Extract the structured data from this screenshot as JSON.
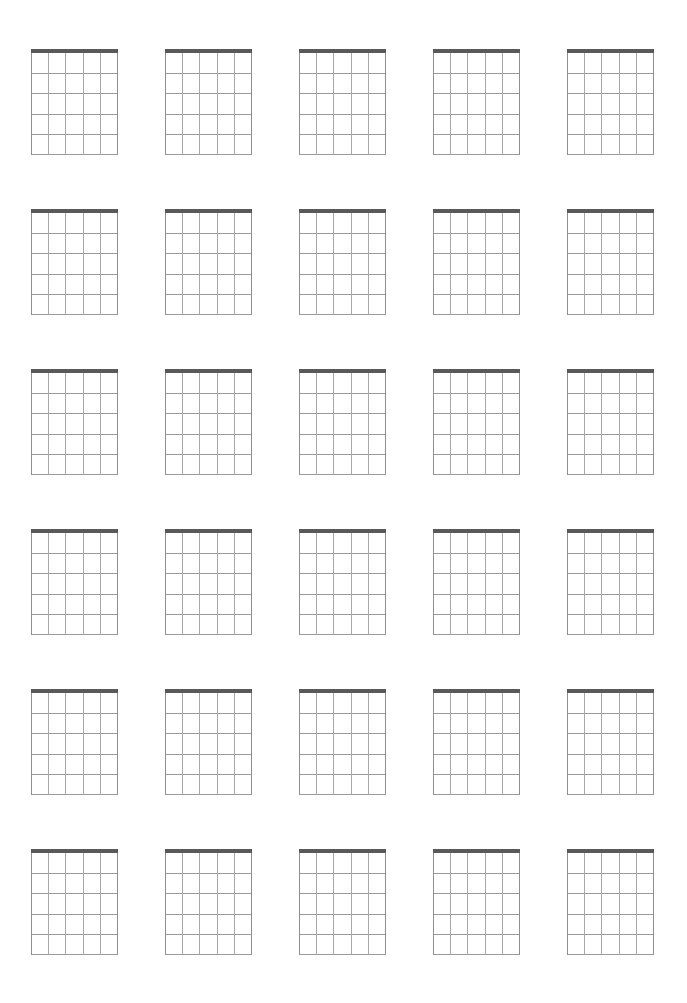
{
  "page": {
    "background_color": "#ffffff",
    "width": 687,
    "height": 1003
  },
  "sheet": {
    "name": "blank-chord-diagram-sheet",
    "columns": 5,
    "rows": 6,
    "total_diagrams": 30,
    "margin_top": 49,
    "margin_left": 31,
    "diagram_width": 87,
    "diagram_height": 106,
    "column_gap": 47,
    "row_gap": 54
  },
  "diagram_spec": {
    "instrument": "guitar",
    "strings": 6,
    "frets": 5,
    "fret_lines": 5,
    "has_nut": true,
    "nut_thickness": 4,
    "nut_color": "#595959",
    "fret_color": "#9a9a9a",
    "string_color": "#a8a8a8",
    "outer_string_color": "#8f8f8f",
    "string_labels": [
      "E",
      "A",
      "D",
      "G",
      "B",
      "e"
    ],
    "fret_labels": [
      "1",
      "2",
      "3",
      "4",
      "5"
    ],
    "markers": [],
    "open_strings": [],
    "muted_strings": [],
    "position_label": ""
  },
  "diagrams": [
    {
      "index": 1,
      "row": 1,
      "col": 1,
      "label": ""
    },
    {
      "index": 2,
      "row": 1,
      "col": 2,
      "label": ""
    },
    {
      "index": 3,
      "row": 1,
      "col": 3,
      "label": ""
    },
    {
      "index": 4,
      "row": 1,
      "col": 4,
      "label": ""
    },
    {
      "index": 5,
      "row": 1,
      "col": 5,
      "label": ""
    },
    {
      "index": 6,
      "row": 2,
      "col": 1,
      "label": ""
    },
    {
      "index": 7,
      "row": 2,
      "col": 2,
      "label": ""
    },
    {
      "index": 8,
      "row": 2,
      "col": 3,
      "label": ""
    },
    {
      "index": 9,
      "row": 2,
      "col": 4,
      "label": ""
    },
    {
      "index": 10,
      "row": 2,
      "col": 5,
      "label": ""
    },
    {
      "index": 11,
      "row": 3,
      "col": 1,
      "label": ""
    },
    {
      "index": 12,
      "row": 3,
      "col": 2,
      "label": ""
    },
    {
      "index": 13,
      "row": 3,
      "col": 3,
      "label": ""
    },
    {
      "index": 14,
      "row": 3,
      "col": 4,
      "label": ""
    },
    {
      "index": 15,
      "row": 3,
      "col": 5,
      "label": ""
    },
    {
      "index": 16,
      "row": 4,
      "col": 1,
      "label": ""
    },
    {
      "index": 17,
      "row": 4,
      "col": 2,
      "label": ""
    },
    {
      "index": 18,
      "row": 4,
      "col": 3,
      "label": ""
    },
    {
      "index": 19,
      "row": 4,
      "col": 4,
      "label": ""
    },
    {
      "index": 20,
      "row": 4,
      "col": 5,
      "label": ""
    },
    {
      "index": 21,
      "row": 5,
      "col": 1,
      "label": ""
    },
    {
      "index": 22,
      "row": 5,
      "col": 2,
      "label": ""
    },
    {
      "index": 23,
      "row": 5,
      "col": 3,
      "label": ""
    },
    {
      "index": 24,
      "row": 5,
      "col": 4,
      "label": ""
    },
    {
      "index": 25,
      "row": 5,
      "col": 5,
      "label": ""
    },
    {
      "index": 26,
      "row": 6,
      "col": 1,
      "label": ""
    },
    {
      "index": 27,
      "row": 6,
      "col": 2,
      "label": ""
    },
    {
      "index": 28,
      "row": 6,
      "col": 3,
      "label": ""
    },
    {
      "index": 29,
      "row": 6,
      "col": 4,
      "label": ""
    },
    {
      "index": 30,
      "row": 6,
      "col": 5,
      "label": ""
    }
  ]
}
